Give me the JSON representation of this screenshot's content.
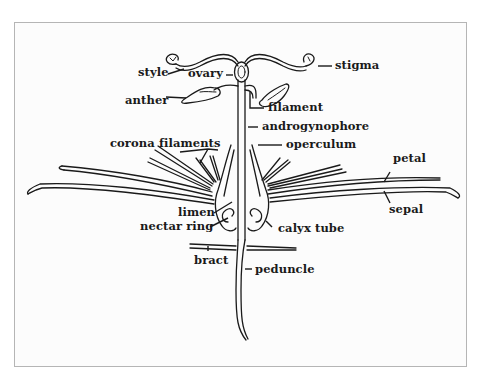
{
  "diagram": {
    "colors": {
      "ink": "#1a1a1a",
      "frame_border": "#b5b5b5",
      "background": "#fcfcfc"
    },
    "labels": {
      "style": "style",
      "ovary": "ovary",
      "stigma": "stigma",
      "anther": "anther",
      "filament": "filament",
      "androgynophore": "androgynophore",
      "corona_filaments": "corona filaments",
      "operculum": "operculum",
      "petal": "petal",
      "sepal": "sepal",
      "limen": "limen",
      "nectar_ring": "nectar ring",
      "calyx_tube": "calyx tube",
      "bract": "bract",
      "peduncle": "peduncle"
    }
  }
}
